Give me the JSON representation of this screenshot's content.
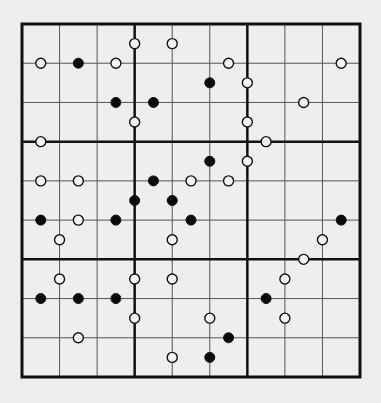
{
  "puzzle": {
    "type": "kropki-sudoku",
    "size": 9,
    "box": 3,
    "colors": {
      "background": "#eeeeec",
      "thin_line": "#555555",
      "thick_line": "#111111",
      "dot_black": "#0a0a0a",
      "dot_white_fill": "#f4f4f2",
      "dot_stroke": "#111111"
    },
    "geometry": {
      "left": 22,
      "top": 24,
      "right": 360,
      "bottom": 377,
      "dot_radius": 5
    },
    "dots": [
      {
        "gx": 3,
        "gy": 0.5,
        "color": "white"
      },
      {
        "gx": 4,
        "gy": 0.5,
        "color": "white"
      },
      {
        "gx": 0.5,
        "gy": 1,
        "color": "white"
      },
      {
        "gx": 1.5,
        "gy": 1,
        "color": "black"
      },
      {
        "gx": 2.5,
        "gy": 1,
        "color": "white"
      },
      {
        "gx": 5.5,
        "gy": 1,
        "color": "white"
      },
      {
        "gx": 8.5,
        "gy": 1,
        "color": "white"
      },
      {
        "gx": 5,
        "gy": 1.5,
        "color": "black"
      },
      {
        "gx": 6,
        "gy": 1.5,
        "color": "white"
      },
      {
        "gx": 2.5,
        "gy": 2,
        "color": "black"
      },
      {
        "gx": 3.5,
        "gy": 2,
        "color": "black"
      },
      {
        "gx": 7.5,
        "gy": 2,
        "color": "white"
      },
      {
        "gx": 3,
        "gy": 2.5,
        "color": "white"
      },
      {
        "gx": 6,
        "gy": 2.5,
        "color": "white"
      },
      {
        "gx": 0.5,
        "gy": 3,
        "color": "white"
      },
      {
        "gx": 6.5,
        "gy": 3,
        "color": "white"
      },
      {
        "gx": 5,
        "gy": 3.5,
        "color": "black"
      },
      {
        "gx": 6,
        "gy": 3.5,
        "color": "white"
      },
      {
        "gx": 0.5,
        "gy": 4,
        "color": "white"
      },
      {
        "gx": 1.5,
        "gy": 4,
        "color": "white"
      },
      {
        "gx": 3.5,
        "gy": 4,
        "color": "black"
      },
      {
        "gx": 4.5,
        "gy": 4,
        "color": "white"
      },
      {
        "gx": 5.5,
        "gy": 4,
        "color": "white"
      },
      {
        "gx": 3,
        "gy": 4.5,
        "color": "black"
      },
      {
        "gx": 4,
        "gy": 4.5,
        "color": "black"
      },
      {
        "gx": 0.5,
        "gy": 5,
        "color": "black"
      },
      {
        "gx": 1.5,
        "gy": 5,
        "color": "white"
      },
      {
        "gx": 2.5,
        "gy": 5,
        "color": "black"
      },
      {
        "gx": 4.5,
        "gy": 5,
        "color": "black"
      },
      {
        "gx": 8.5,
        "gy": 5,
        "color": "black"
      },
      {
        "gx": 1,
        "gy": 5.5,
        "color": "white"
      },
      {
        "gx": 4,
        "gy": 5.5,
        "color": "white"
      },
      {
        "gx": 8,
        "gy": 5.5,
        "color": "white"
      },
      {
        "gx": 7.5,
        "gy": 6,
        "color": "white"
      },
      {
        "gx": 1,
        "gy": 6.5,
        "color": "white"
      },
      {
        "gx": 3,
        "gy": 6.5,
        "color": "white"
      },
      {
        "gx": 4,
        "gy": 6.5,
        "color": "white"
      },
      {
        "gx": 7,
        "gy": 6.5,
        "color": "white"
      },
      {
        "gx": 0.5,
        "gy": 7,
        "color": "black"
      },
      {
        "gx": 1.5,
        "gy": 7,
        "color": "black"
      },
      {
        "gx": 2.5,
        "gy": 7,
        "color": "black"
      },
      {
        "gx": 6.5,
        "gy": 7,
        "color": "black"
      },
      {
        "gx": 3,
        "gy": 7.5,
        "color": "white"
      },
      {
        "gx": 5,
        "gy": 7.5,
        "color": "white"
      },
      {
        "gx": 7,
        "gy": 7.5,
        "color": "white"
      },
      {
        "gx": 1.5,
        "gy": 8,
        "color": "white"
      },
      {
        "gx": 5.5,
        "gy": 8,
        "color": "black"
      },
      {
        "gx": 4,
        "gy": 8.5,
        "color": "white"
      },
      {
        "gx": 5,
        "gy": 8.5,
        "color": "black"
      }
    ]
  }
}
